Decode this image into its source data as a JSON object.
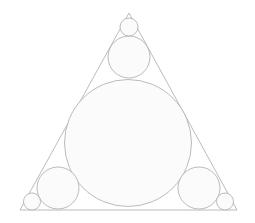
{
  "figure": {
    "canvas": {
      "width": 255,
      "height": 223,
      "background": "#ffffff"
    },
    "style": {
      "stroke_color": "#b3b3b3",
      "stroke_width": 0.9,
      "fill_color": "#fbfbfb",
      "triangle_fill": "none",
      "triangle_stroke": "#b3b3b3",
      "triangle_stroke_width": 0.9
    },
    "triangle": {
      "name": "outer-triangle",
      "vertices": [
        {
          "label": "apex",
          "x": 129,
          "y": 13
        },
        {
          "label": "bottom-left",
          "x": 20,
          "y": 210
        },
        {
          "label": "bottom-right",
          "x": 237,
          "y": 210
        }
      ],
      "points_attr": "129,13 20,210 237,210"
    },
    "circles": [
      {
        "name": "incircle",
        "role": "central-incircle",
        "cx": 128,
        "cy": 143,
        "r": 63.5
      },
      {
        "name": "apex-malfatti-circle",
        "role": "corner-circle-apex",
        "cx": 129,
        "cy": 57,
        "r": 21
      },
      {
        "name": "apex-corner-circle",
        "role": "small-corner-circle-apex",
        "cx": 129,
        "cy": 27,
        "r": 9
      },
      {
        "name": "bottom-left-malfatti-circle",
        "role": "corner-circle-bottom-left",
        "cx": 58,
        "cy": 188,
        "r": 21
      },
      {
        "name": "bottom-left-corner-circle",
        "role": "small-corner-circle-bottom-left",
        "cx": 32,
        "cy": 201.5,
        "r": 8.5
      },
      {
        "name": "bottom-right-malfatti-circle",
        "role": "corner-circle-bottom-right",
        "cx": 199,
        "cy": 188,
        "r": 21
      },
      {
        "name": "bottom-right-corner-circle",
        "role": "small-corner-circle-bottom-right",
        "cx": 225,
        "cy": 201.5,
        "r": 8.5
      }
    ],
    "labels": []
  }
}
